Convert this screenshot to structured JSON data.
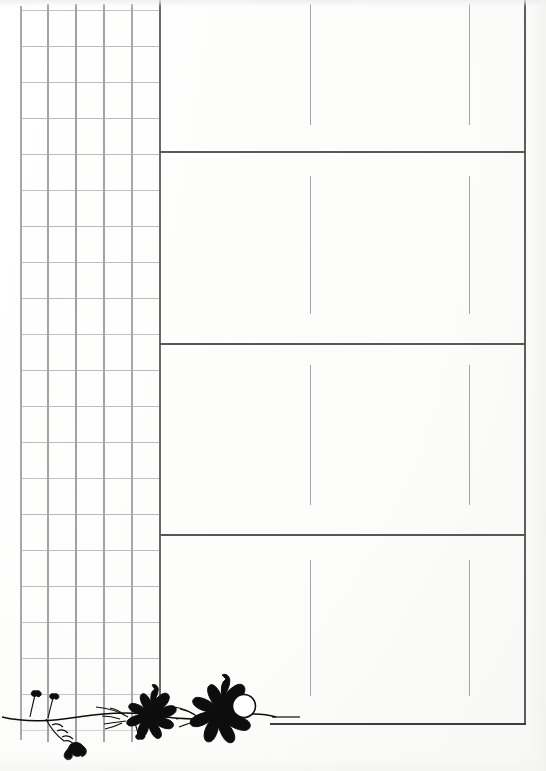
{
  "document": {
    "title": "",
    "background_color": "#fefefe",
    "width": 546,
    "height": 771
  },
  "colors": {
    "paper": "#fefefe",
    "grid_line_minor": "#b9b9bb",
    "grid_line_major": "#8e8e92",
    "rule_line": "#4a4a4c",
    "divider_heavy": "#5a5a5c",
    "tick_line": "#9a9a9e",
    "ornament_ink": "#0d0d0d"
  },
  "grid_panel": {
    "name": "graph-paper-grid",
    "left": 21,
    "right": 160,
    "top": 10,
    "bottom": 731,
    "column_count": 5,
    "row_count": 20,
    "column_x": [
      21,
      48,
      76,
      104,
      132,
      160
    ],
    "row_spacing": 36,
    "row_y": [
      10,
      46,
      82,
      118,
      154,
      190,
      226,
      262,
      298,
      334,
      370,
      406,
      442,
      478,
      514,
      550,
      586,
      622,
      658,
      694,
      730
    ]
  },
  "ruled_panel": {
    "name": "ruled-writing-panel",
    "left": 160,
    "right": 525,
    "top": 0,
    "bottom": 724,
    "section_divider_y": [
      152,
      344,
      535
    ],
    "bottom_rule_y": 724,
    "bottom_rule_left": 270,
    "tick_columns_x": [
      310,
      469
    ],
    "sections": [
      {
        "index": 1,
        "name": "section-one",
        "top": 0,
        "bottom": 152,
        "tick_top": 4,
        "tick_bottom": 125
      },
      {
        "index": 2,
        "name": "section-two",
        "top": 152,
        "bottom": 344,
        "tick_top": 176,
        "tick_bottom": 314
      },
      {
        "index": 3,
        "name": "section-three",
        "top": 344,
        "bottom": 535,
        "tick_top": 365,
        "tick_bottom": 505
      },
      {
        "index": 4,
        "name": "section-four",
        "top": 535,
        "bottom": 724,
        "tick_top": 560,
        "tick_bottom": 696
      }
    ]
  },
  "ornament": {
    "name": "floral-vine-ornament",
    "position": "bottom-left",
    "left": 0,
    "bottom": 0,
    "width": 300,
    "height": 110,
    "ink_color": "#0d0d0d",
    "elements": [
      "vine-stem",
      "small-bud-left",
      "small-bud-left-two",
      "leaf-spray-left",
      "small-dark-leaf",
      "mid-flower",
      "leaf-spray-mid",
      "large-flower",
      "large-flower-center-circle",
      "trailing-rule"
    ]
  }
}
